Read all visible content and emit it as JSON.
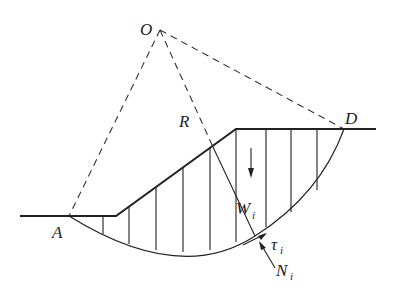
{
  "figure": {
    "labels": {
      "center": "O",
      "radius": "R",
      "left_point": "A",
      "right_point": "D",
      "weight": "W",
      "weight_sub": "i",
      "shear": "τ",
      "shear_sub": "i",
      "normal": "N",
      "normal_sub": "i"
    },
    "colors": {
      "line": "#222222",
      "background": "#ffffff"
    },
    "slice_count": 10
  }
}
